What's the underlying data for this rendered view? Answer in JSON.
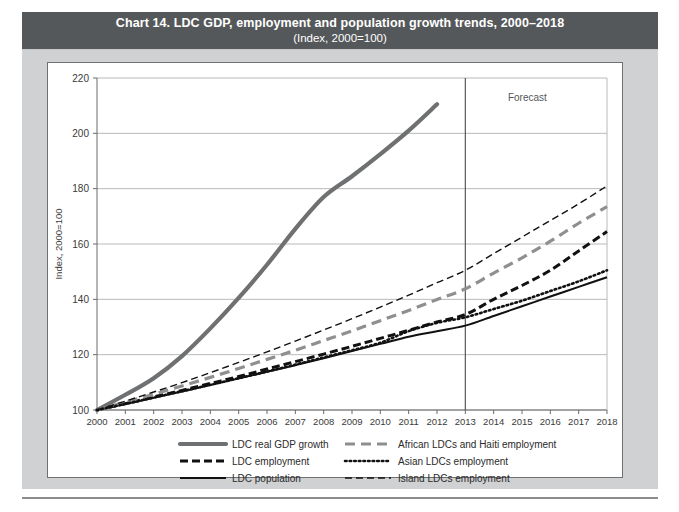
{
  "title": {
    "main": "Chart 14. LDC GDP, employment and population growth trends, 2000–2018",
    "sub": "(Index, 2000=100)"
  },
  "annotations": {
    "forecast": "Forecast"
  },
  "colors": {
    "title_bar_bg": "#55585a",
    "panel_bg": "#d0d1d2",
    "card_bg": "#ffffff",
    "grid": "#b9b9b9",
    "gdp_line": "#6e7072",
    "african_line": "#8d8f91",
    "black_line": "#111111",
    "forecast_divider": "#55585a"
  },
  "chart_data": {
    "type": "line",
    "title": "Chart 14. LDC GDP, employment and population growth trends, 2000–2018",
    "subtitle": "(Index, 2000=100)",
    "xlabel": "",
    "ylabel": "Index, 2000=100",
    "ylim": [
      100,
      220
    ],
    "yticks": [
      100,
      120,
      140,
      160,
      180,
      200,
      220
    ],
    "grid": true,
    "legend_position": "bottom",
    "forecast_start": 2013,
    "x": [
      2000,
      2001,
      2002,
      2003,
      2004,
      2005,
      2006,
      2007,
      2008,
      2009,
      2010,
      2011,
      2012,
      2013,
      2014,
      2015,
      2016,
      2017,
      2018
    ],
    "xticklabels": [
      "2000",
      "2001",
      "2002",
      "2003",
      "2004",
      "2005",
      "2006",
      "2007",
      "2008",
      "2009",
      "2010",
      "2011",
      "2012",
      "2013",
      "2014",
      "2015",
      "2016",
      "2017",
      "2018"
    ],
    "series": [
      {
        "name": "LDC real GDP growth",
        "style": "solid-thick-grey",
        "color": "#6e7072",
        "values": [
          100,
          105.5,
          111.5,
          119.5,
          129.5,
          140.5,
          152.5,
          165.5,
          177.0,
          184.5,
          192.5,
          201.0,
          210.5,
          null,
          null,
          null,
          null,
          null,
          null
        ]
      },
      {
        "name": "LDC employment",
        "style": "dashed-thick-black",
        "color": "#111111",
        "values": [
          100,
          102.3,
          104.7,
          107.1,
          109.6,
          112.1,
          114.8,
          117.5,
          120.2,
          123.0,
          125.9,
          128.8,
          131.8,
          134.5,
          140.0,
          145.0,
          150.5,
          157.5,
          164.5
        ]
      },
      {
        "name": "LDC population",
        "style": "solid-thin-black",
        "color": "#111111",
        "values": [
          100,
          102.2,
          104.4,
          106.7,
          109.0,
          111.4,
          113.8,
          116.2,
          118.7,
          121.3,
          123.9,
          126.5,
          128.5,
          130.5,
          134.0,
          137.5,
          141.0,
          144.5,
          148.0
        ]
      },
      {
        "name": "African LDCs and  Haiti employment",
        "style": "dashed-thick-grey",
        "color": "#8d8f91",
        "values": [
          100,
          102.8,
          105.7,
          108.7,
          111.8,
          115.0,
          118.3,
          121.6,
          125.1,
          128.6,
          132.3,
          136.0,
          139.9,
          143.8,
          149.5,
          155.0,
          161.0,
          167.5,
          173.5
        ]
      },
      {
        "name": "Asian LDCs employment",
        "style": "dotted-black",
        "color": "#111111",
        "values": [
          100,
          102.2,
          104.5,
          106.8,
          109.1,
          111.5,
          113.9,
          116.4,
          119.0,
          121.6,
          124.3,
          128.5,
          131.5,
          133.5,
          136.5,
          139.5,
          143.0,
          146.5,
          150.5
        ]
      },
      {
        "name": "Island LDCs employment",
        "style": "dashed-thin-black",
        "color": "#111111",
        "values": [
          100,
          103.2,
          106.5,
          109.9,
          113.5,
          117.2,
          121.0,
          124.9,
          128.9,
          133.0,
          137.2,
          141.5,
          146.0,
          150.5,
          156.5,
          162.5,
          168.5,
          174.5,
          181.0
        ]
      }
    ]
  },
  "legend": {
    "left_column": [
      {
        "label": "LDC real GDP growth",
        "style": "solid-thick-grey"
      },
      {
        "label": "LDC employment",
        "style": "dashed-thick-black"
      },
      {
        "label": "LDC population",
        "style": "solid-thin-black"
      }
    ],
    "right_column": [
      {
        "label": "African LDCs and  Haiti employment",
        "style": "dashed-thick-grey"
      },
      {
        "label": "Asian LDCs employment",
        "style": "dotted-black"
      },
      {
        "label": "Island LDCs employment",
        "style": "dashed-thin-black"
      }
    ]
  }
}
